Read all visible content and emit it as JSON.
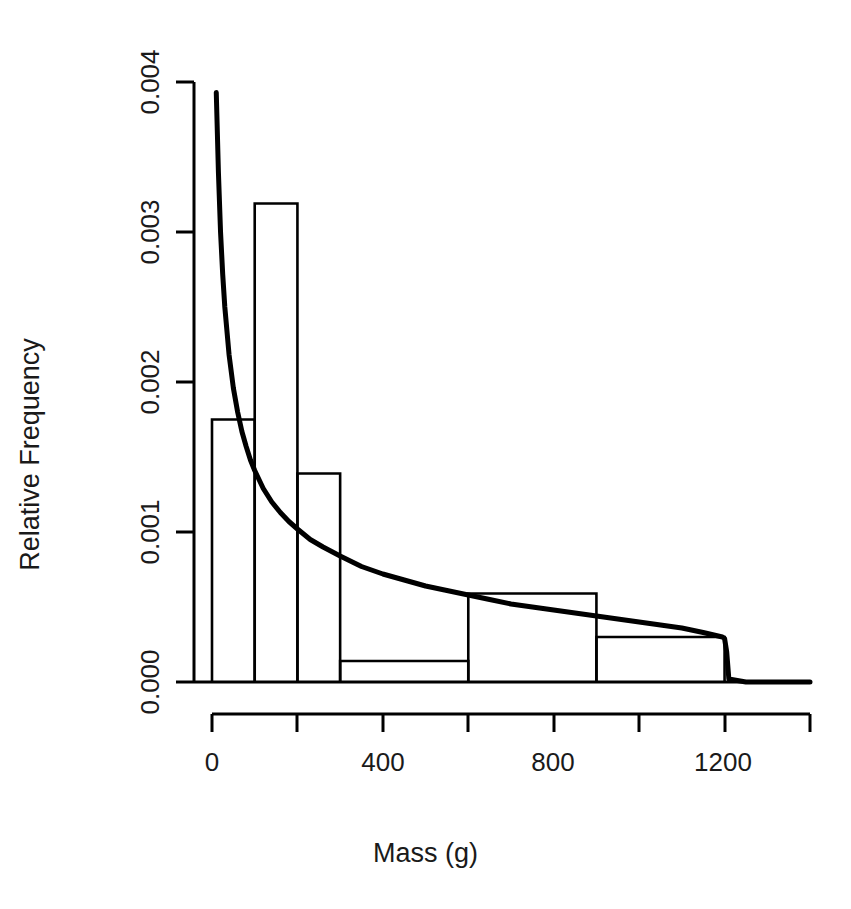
{
  "figure": {
    "cutoff_header_fragment": "........ ... .......",
    "background_color": "#ffffff",
    "ink_color": "#000000"
  },
  "axes": {
    "ylabel": "Relative Frequency",
    "xlabel": "Mass (g)",
    "ytick_labels": [
      "0.000",
      "0.001",
      "0.002",
      "0.003",
      "0.004"
    ],
    "xtick_labels_shown": [
      "0",
      "400",
      "800",
      "1200"
    ]
  },
  "chart_data": {
    "type": "bar",
    "title": "",
    "subtitle": "",
    "xlabel": "Mass (g)",
    "ylabel": "Relative Frequency",
    "xlim": [
      0,
      1400
    ],
    "ylim": [
      0.0,
      0.004
    ],
    "grid": false,
    "legend": null,
    "yticks": [
      0.0,
      0.001,
      0.002,
      0.003,
      0.004
    ],
    "ytick_labels": [
      "0.000",
      "0.001",
      "0.002",
      "0.003",
      "0.004"
    ],
    "xticks": [
      0,
      200,
      400,
      600,
      800,
      1000,
      1200,
      1400
    ],
    "xtick_labels": [
      "0",
      "",
      "400",
      "",
      "800",
      "",
      "1200",
      ""
    ],
    "histogram": {
      "name": "Relative frequency histogram",
      "bin_edges": [
        0,
        100,
        200,
        300,
        600,
        900,
        1200
      ],
      "densities": [
        0.00175,
        0.00319,
        0.00139,
        0.00014,
        0.00059,
        0.0003
      ],
      "fill": "none",
      "stroke": "#000000"
    },
    "series": [
      {
        "name": "fitted density curve",
        "type": "line",
        "stroke": "#000000",
        "linewidth": 3,
        "x": [
          10,
          15,
          20,
          25,
          30,
          40,
          50,
          60,
          70,
          80,
          90,
          100,
          120,
          140,
          160,
          180,
          200,
          230,
          260,
          300,
          350,
          400,
          450,
          500,
          550,
          600,
          650,
          700,
          750,
          800,
          850,
          900,
          950,
          1000,
          1050,
          1100,
          1150,
          1180,
          1195,
          1200,
          1205,
          1210,
          1250,
          1300,
          1400
        ],
        "y": [
          0.00393,
          0.0034,
          0.003,
          0.00272,
          0.0025,
          0.00218,
          0.00196,
          0.0018,
          0.00167,
          0.00157,
          0.00148,
          0.00141,
          0.00129,
          0.0012,
          0.00113,
          0.00107,
          0.00102,
          0.00095,
          0.0009,
          0.00084,
          0.00077,
          0.00072,
          0.00068,
          0.00064,
          0.00061,
          0.00058,
          0.00055,
          0.00052,
          0.0005,
          0.00048,
          0.00046,
          0.00044,
          0.00042,
          0.0004,
          0.00038,
          0.00036,
          0.00033,
          0.00031,
          0.0003,
          0.00029,
          0.0002,
          2e-05,
          0.0,
          0.0,
          0.0
        ]
      }
    ]
  },
  "geometry": {
    "x_origin_px": 212,
    "x_scale_px_per_unit": 0.42714,
    "y_zero_px": 682,
    "y_scale_px_per_unit": 150000
  }
}
